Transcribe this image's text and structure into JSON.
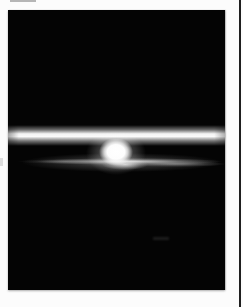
{
  "image": {
    "type": "photograph",
    "description": "Black-and-white photograph of a sunset seen from space: a bright horizontal band of sunlit atmosphere stretches across a black sky above a glowing white sun disc that rests on a thin, wispy gray cloud/horizon layer. The print has a white border, a faint smudge in the top margin, and a dark vertical line along the right edge of the page.",
    "subject": "sunset over Earth horizon from orbit",
    "monochrome": true
  },
  "colors": {
    "page-bg": "#fcfcfc",
    "photo-bg": "#040404",
    "band-core": "#f4f4f4",
    "sun-core": "#ffffff",
    "streak-gray": "#9a9a9a",
    "edge-line": "#1f1f1f"
  }
}
